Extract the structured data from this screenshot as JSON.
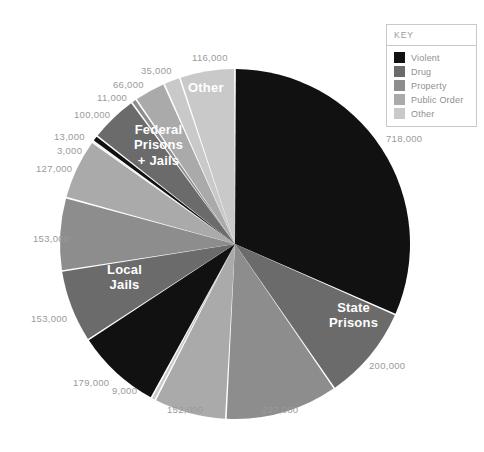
{
  "legend": {
    "title": "KEY",
    "items": [
      {
        "label": "Violent",
        "color": "#111111"
      },
      {
        "label": "Drug",
        "color": "#6b6b6b"
      },
      {
        "label": "Property",
        "color": "#8d8d8d"
      },
      {
        "label": "Public Order",
        "color": "#aaaaaa"
      },
      {
        "label": "Other",
        "color": "#c9c9c9"
      }
    ]
  },
  "group_labels": [
    {
      "text": "State\nPrisons",
      "x": 329,
      "y": 300
    },
    {
      "text": "Local\nJails",
      "x": 107,
      "y": 262
    },
    {
      "text": "Federal\nPrisons\n+ Jails",
      "x": 134,
      "y": 122
    },
    {
      "text": "Other",
      "x": 188,
      "y": 80
    }
  ],
  "value_labels": [
    {
      "text": "718,000",
      "x": 386,
      "y": 133
    },
    {
      "text": "200,000",
      "x": 369,
      "y": 360
    },
    {
      "text": "237,000",
      "x": 262,
      "y": 404
    },
    {
      "text": "152,000",
      "x": 167,
      "y": 404
    },
    {
      "text": "9,000",
      "x": 112,
      "y": 385
    },
    {
      "text": "179,000",
      "x": 73,
      "y": 377
    },
    {
      "text": "153,000",
      "x": 31,
      "y": 313
    },
    {
      "text": "153,000",
      "x": 33,
      "y": 233
    },
    {
      "text": "127,000",
      "x": 36,
      "y": 163
    },
    {
      "text": "3,000",
      "x": 57,
      "y": 145
    },
    {
      "text": "13,000",
      "x": 54,
      "y": 131
    },
    {
      "text": "100,000",
      "x": 74,
      "y": 109
    },
    {
      "text": "11,000",
      "x": 97,
      "y": 92
    },
    {
      "text": "66,000",
      "x": 113,
      "y": 79
    },
    {
      "text": "35,000",
      "x": 141,
      "y": 65
    },
    {
      "text": "116,000",
      "x": 192,
      "y": 52
    }
  ],
  "chart_data": {
    "type": "pie",
    "title": "",
    "center": {
      "x": 235,
      "y": 244
    },
    "radius": 175,
    "start_angle_deg": 0,
    "direction": "clockwise",
    "gap_deg": 0.55,
    "total": 2272000,
    "groups": [
      "State Prisons",
      "Local Jails",
      "Federal Prisons + Jails",
      "Other"
    ],
    "legend_position": "top-right",
    "slices": [
      {
        "label": "718,000",
        "value": 718000,
        "group": "State Prisons",
        "category": "Violent",
        "color": "#111111"
      },
      {
        "label": "200,000",
        "value": 200000,
        "group": "State Prisons",
        "category": "Drug",
        "color": "#6b6b6b"
      },
      {
        "label": "237,000",
        "value": 237000,
        "group": "State Prisons",
        "category": "Property",
        "color": "#8d8d8d"
      },
      {
        "label": "152,000",
        "value": 152000,
        "group": "State Prisons",
        "category": "Public Order",
        "color": "#aaaaaa"
      },
      {
        "label": "9,000",
        "value": 9000,
        "group": "State Prisons",
        "category": "Other",
        "color": "#c9c9c9"
      },
      {
        "label": "179,000",
        "value": 179000,
        "group": "Local Jails",
        "category": "Violent",
        "color": "#111111"
      },
      {
        "label": "153,000",
        "value": 153000,
        "group": "Local Jails",
        "category": "Drug",
        "color": "#6b6b6b"
      },
      {
        "label": "153,000",
        "value": 153000,
        "group": "Local Jails",
        "category": "Property",
        "color": "#8d8d8d"
      },
      {
        "label": "127,000",
        "value": 127000,
        "group": "Local Jails",
        "category": "Public Order",
        "color": "#aaaaaa"
      },
      {
        "label": "3,000",
        "value": 3000,
        "group": "Local Jails",
        "category": "Other",
        "color": "#c9c9c9"
      },
      {
        "label": "13,000",
        "value": 13000,
        "group": "Federal Prisons + Jails",
        "category": "Violent",
        "color": "#111111"
      },
      {
        "label": "100,000",
        "value": 100000,
        "group": "Federal Prisons + Jails",
        "category": "Drug",
        "color": "#6b6b6b"
      },
      {
        "label": "11,000",
        "value": 11000,
        "group": "Federal Prisons + Jails",
        "category": "Property",
        "color": "#8d8d8d"
      },
      {
        "label": "66,000",
        "value": 66000,
        "group": "Federal Prisons + Jails",
        "category": "Public Order",
        "color": "#aaaaaa"
      },
      {
        "label": "35,000",
        "value": 35000,
        "group": "Federal Prisons + Jails",
        "category": "Other",
        "color": "#c9c9c9"
      },
      {
        "label": "116,000",
        "value": 116000,
        "group": "Other",
        "category": "Other",
        "color": "#c9c9c9"
      }
    ]
  }
}
